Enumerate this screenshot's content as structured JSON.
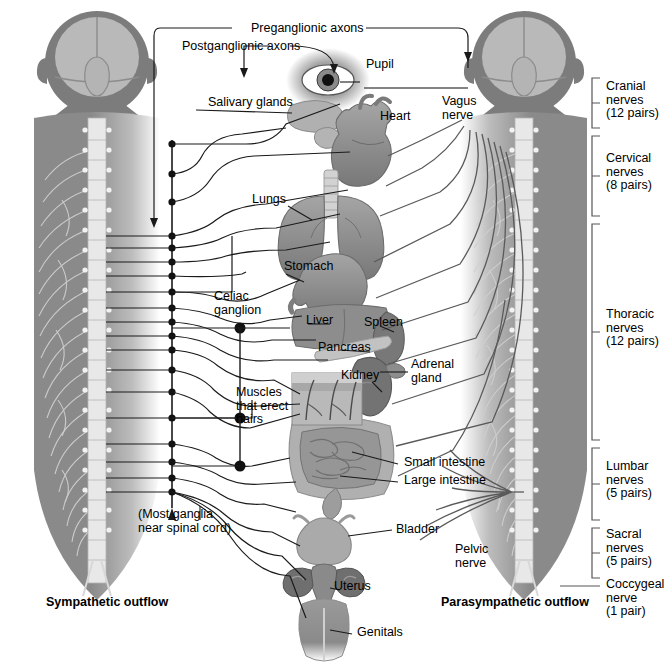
{
  "figure": {
    "title_left": "Sympathetic outflow",
    "title_right": "Parasympathetic outflow",
    "note_ganglia": "(Most ganglia\nnear spinal cord)"
  },
  "axon_labels": {
    "preganglionic": "Preganglionic axons",
    "postganglionic": "Postganglionic axons"
  },
  "organs": [
    {
      "key": "pupil",
      "label": "Pupil"
    },
    {
      "key": "salivary_glands",
      "label": "Salivary glands"
    },
    {
      "key": "heart",
      "label": "Heart"
    },
    {
      "key": "lungs",
      "label": "Lungs"
    },
    {
      "key": "stomach",
      "label": "Stomach"
    },
    {
      "key": "liver",
      "label": "Liver"
    },
    {
      "key": "spleen",
      "label": "Spleen"
    },
    {
      "key": "pancreas",
      "label": "Pancreas"
    },
    {
      "key": "kidney",
      "label": "Kidney"
    },
    {
      "key": "adrenal_gland",
      "label": "Adrenal\ngland"
    },
    {
      "key": "muscles_erect_hairs",
      "label": "Muscles\nthat erect\nhairs"
    },
    {
      "key": "small_intestine",
      "label": "Small intestine"
    },
    {
      "key": "large_intestine",
      "label": "Large intestine"
    },
    {
      "key": "bladder",
      "label": "Bladder"
    },
    {
      "key": "uterus",
      "label": "Uterus"
    },
    {
      "key": "genitals",
      "label": "Genitals"
    }
  ],
  "ganglia": [
    {
      "key": "celiac_ganglion",
      "label": "Celiac\nganglion"
    }
  ],
  "nerves": [
    {
      "key": "vagus_nerve",
      "label": "Vagus\nnerve"
    },
    {
      "key": "pelvic_nerve",
      "label": "Pelvic\nnerve"
    }
  ],
  "spinal_nerve_groups": [
    {
      "key": "cranial",
      "label": "Cranial\nnerves\n(12 pairs)",
      "name": "Cranial nerves",
      "pairs": "12 pairs"
    },
    {
      "key": "cervical",
      "label": "Cervical\nnerves\n(8 pairs)",
      "name": "Cervical nerves",
      "pairs": "8 pairs"
    },
    {
      "key": "thoracic",
      "label": "Thoracic\nnerves\n(12 pairs)",
      "name": "Thoracic nerves",
      "pairs": "12 pairs"
    },
    {
      "key": "lumbar",
      "label": "Lumbar\nnerves\n(5 pairs)",
      "name": "Lumbar nerves",
      "pairs": "5 pairs"
    },
    {
      "key": "sacral",
      "label": "Sacral\nnerves\n(5 pairs)",
      "name": "Sacral nerves",
      "pairs": "5 pairs"
    },
    {
      "key": "coccygeal",
      "label": "Coccygeal\nnerve\n(1 pair)",
      "name": "Coccygeal nerve",
      "pairs": "1 pair"
    }
  ],
  "colors": {
    "body_gray": "#7c7c7c",
    "body_gray_dark": "#6a6a6a",
    "brain_light": "#b9b9b9",
    "organ_mid": "#8d8d8d",
    "organ_dark": "#6f6f6f",
    "organ_light": "#b4b4b4",
    "line": "#1a1a1a",
    "line_soft": "#4a4a4a",
    "cord_light": "#e2e2e2",
    "bracket": "#555555",
    "text": "#000000"
  }
}
